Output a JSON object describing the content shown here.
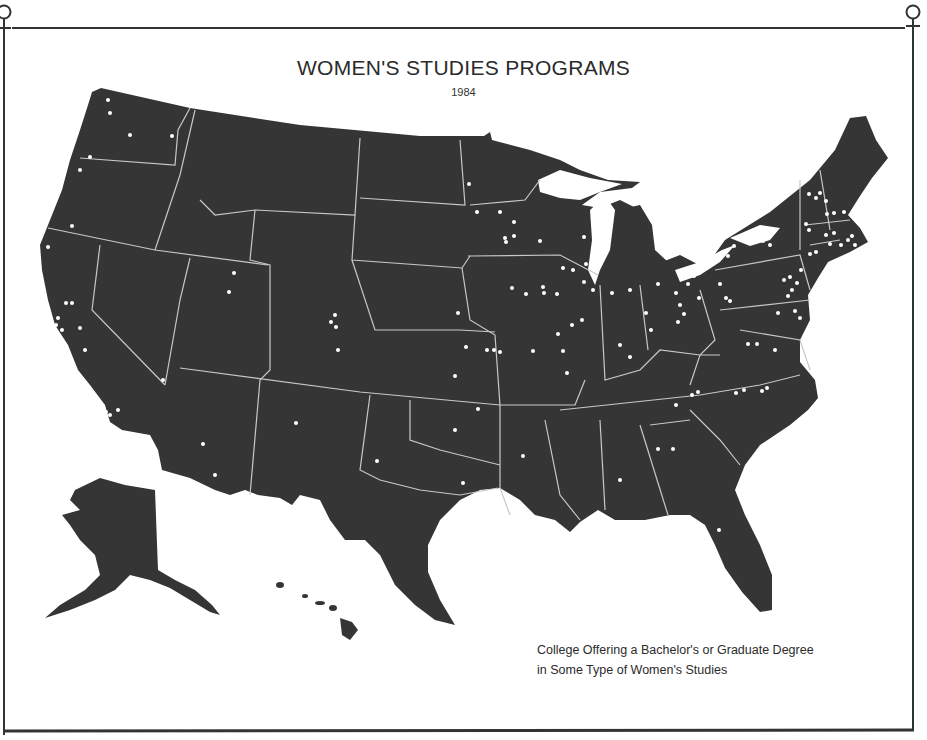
{
  "title": "WOMEN'S STUDIES PROGRAMS",
  "subtitle": "1984",
  "legend": {
    "line1": "College Offering a Bachelor's  or Graduate Degree",
    "line2": "in Some Type of Women's  Studies",
    "marker": "white-dot"
  },
  "colors": {
    "land": "#353535",
    "borders": "#c8c8c8",
    "dots": "#ffffff",
    "background": "#ffffff",
    "frame": "#333333"
  },
  "decorations": {
    "corner_symbols": [
      "venus-symbol-top-left",
      "venus-symbol-top-right"
    ]
  },
  "regions": [
    "contiguous-united-states",
    "alaska",
    "hawaii"
  ]
}
